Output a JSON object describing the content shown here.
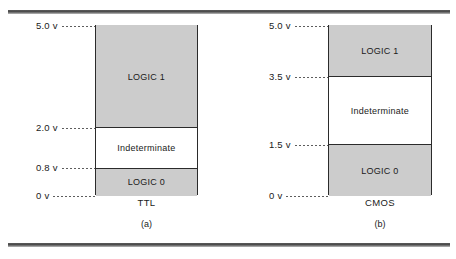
{
  "figure": {
    "frame_color": "#4a4a4a",
    "band_fill": "#cccccc",
    "band_outline": "#2b2b2b",
    "panels": [
      {
        "id": "a",
        "tech_label": "TTL",
        "sub_caption": "(a)",
        "axis_min": 0,
        "axis_max": 5.0,
        "unit": "v",
        "ticks": [
          {
            "value": "5.0",
            "unit": "v",
            "level": 5.0
          },
          {
            "value": "2.0",
            "unit": "v",
            "level": 2.0
          },
          {
            "value": "0.8",
            "unit": "v",
            "level": 0.8
          },
          {
            "value": "0",
            "unit": "v",
            "level": 0.0
          }
        ],
        "bands": [
          {
            "label": "LOGIC 1",
            "kind": "logic",
            "from": 2.0,
            "to": 5.0
          },
          {
            "label": "Indeterminate",
            "kind": "indet",
            "from": 0.8,
            "to": 2.0
          },
          {
            "label": "LOGIC 0",
            "kind": "logic",
            "from": 0.0,
            "to": 0.8
          }
        ]
      },
      {
        "id": "b",
        "tech_label": "CMOS",
        "sub_caption": "(b)",
        "axis_min": 0,
        "axis_max": 5.0,
        "unit": "v",
        "ticks": [
          {
            "value": "5.0",
            "unit": "v",
            "level": 5.0
          },
          {
            "value": "3.5",
            "unit": "v",
            "level": 3.5
          },
          {
            "value": "1.5",
            "unit": "v",
            "level": 1.5
          },
          {
            "value": "0",
            "unit": "v",
            "level": 0.0
          }
        ],
        "bands": [
          {
            "label": "LOGIC 1",
            "kind": "logic",
            "from": 3.5,
            "to": 5.0
          },
          {
            "label": "Indeterminate",
            "kind": "indet",
            "from": 1.5,
            "to": 3.5
          },
          {
            "label": "LOGIC 0",
            "kind": "logic",
            "from": 0.0,
            "to": 1.5
          }
        ]
      }
    ]
  },
  "chart_data": {
    "type": "bar",
    "title": "",
    "xlabel": "",
    "ylabel": "",
    "ylim": [
      0,
      5.0
    ],
    "categories": [
      "TTL",
      "CMOS"
    ],
    "series": [
      {
        "name": "LOGIC 0 upper bound",
        "values": [
          0.8,
          1.5
        ]
      },
      {
        "name": "LOGIC 1 lower bound",
        "values": [
          2.0,
          3.5
        ]
      },
      {
        "name": "Supply / LOGIC 1 upper",
        "values": [
          5.0,
          5.0
        ]
      }
    ],
    "regions": [
      {
        "category": "TTL",
        "label": "LOGIC 0",
        "min": 0.0,
        "max": 0.8,
        "fill": "#cccccc"
      },
      {
        "category": "TTL",
        "label": "Indeterminate",
        "min": 0.8,
        "max": 2.0,
        "fill": "#ffffff"
      },
      {
        "category": "TTL",
        "label": "LOGIC 1",
        "min": 2.0,
        "max": 5.0,
        "fill": "#cccccc"
      },
      {
        "category": "CMOS",
        "label": "LOGIC 0",
        "min": 0.0,
        "max": 1.5,
        "fill": "#cccccc"
      },
      {
        "category": "CMOS",
        "label": "Indeterminate",
        "min": 1.5,
        "max": 3.5,
        "fill": "#ffffff"
      },
      {
        "category": "CMOS",
        "label": "LOGIC 1",
        "min": 3.5,
        "max": 5.0,
        "fill": "#cccccc"
      }
    ],
    "tick_labels": {
      "TTL": [
        "0 v",
        "0.8 v",
        "2.0 v",
        "5.0 v"
      ],
      "CMOS": [
        "0 v",
        "1.5 v",
        "3.5 v",
        "5.0 v"
      ]
    },
    "grid": false,
    "legend": "none"
  }
}
